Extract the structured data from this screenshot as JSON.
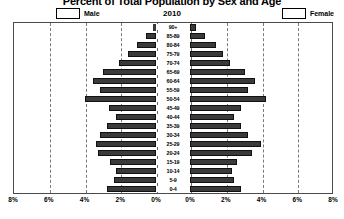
{
  "chart_data": {
    "type": "bar",
    "chart_subtype": "population-pyramid",
    "title": "Percent of Total Population by Sex and Age",
    "year_label": "2010",
    "xlabel": "",
    "ylabel": "",
    "xlim": [
      -8,
      8
    ],
    "xticks_left": [
      "8%",
      "6%",
      "4%",
      "2%",
      "0%"
    ],
    "xticks_right": [
      "0%",
      "2%",
      "4%",
      "6%",
      "8%"
    ],
    "xtick_values_left": [
      8,
      6,
      4,
      2,
      0
    ],
    "xtick_values_right": [
      0,
      2,
      4,
      6,
      8
    ],
    "grid": true,
    "legend_position": "top",
    "colors": {
      "male_bar": "#3a3a3a",
      "female_bar": "#3a3a3a",
      "bar_border": "#111111",
      "plot_border": "#4b4b4b",
      "gridline": "#7a7a7a",
      "background": "#ffffff"
    },
    "categories": [
      "90+",
      "85-89",
      "80-84",
      "75-79",
      "70-74",
      "65-69",
      "60-64",
      "55-59",
      "50-54",
      "45-49",
      "40-44",
      "35-39",
      "30-34",
      "25-29",
      "20-24",
      "15-19",
      "10-14",
      "5-9",
      "0-4"
    ],
    "series": [
      {
        "name": "Male",
        "side": "left",
        "values": [
          0.15,
          0.55,
          1.05,
          1.55,
          2.05,
          2.95,
          3.55,
          3.15,
          3.95,
          2.65,
          2.25,
          2.75,
          3.15,
          3.35,
          3.25,
          2.55,
          2.25,
          2.35,
          2.75
        ]
      },
      {
        "name": "Female",
        "side": "right",
        "values": [
          0.35,
          0.85,
          1.45,
          1.85,
          2.25,
          3.05,
          3.65,
          3.25,
          4.25,
          2.85,
          2.45,
          2.85,
          3.25,
          3.95,
          3.45,
          2.65,
          2.35,
          2.45,
          2.85
        ]
      }
    ]
  },
  "legend": {
    "male_label": "Male",
    "female_label": "Female"
  }
}
